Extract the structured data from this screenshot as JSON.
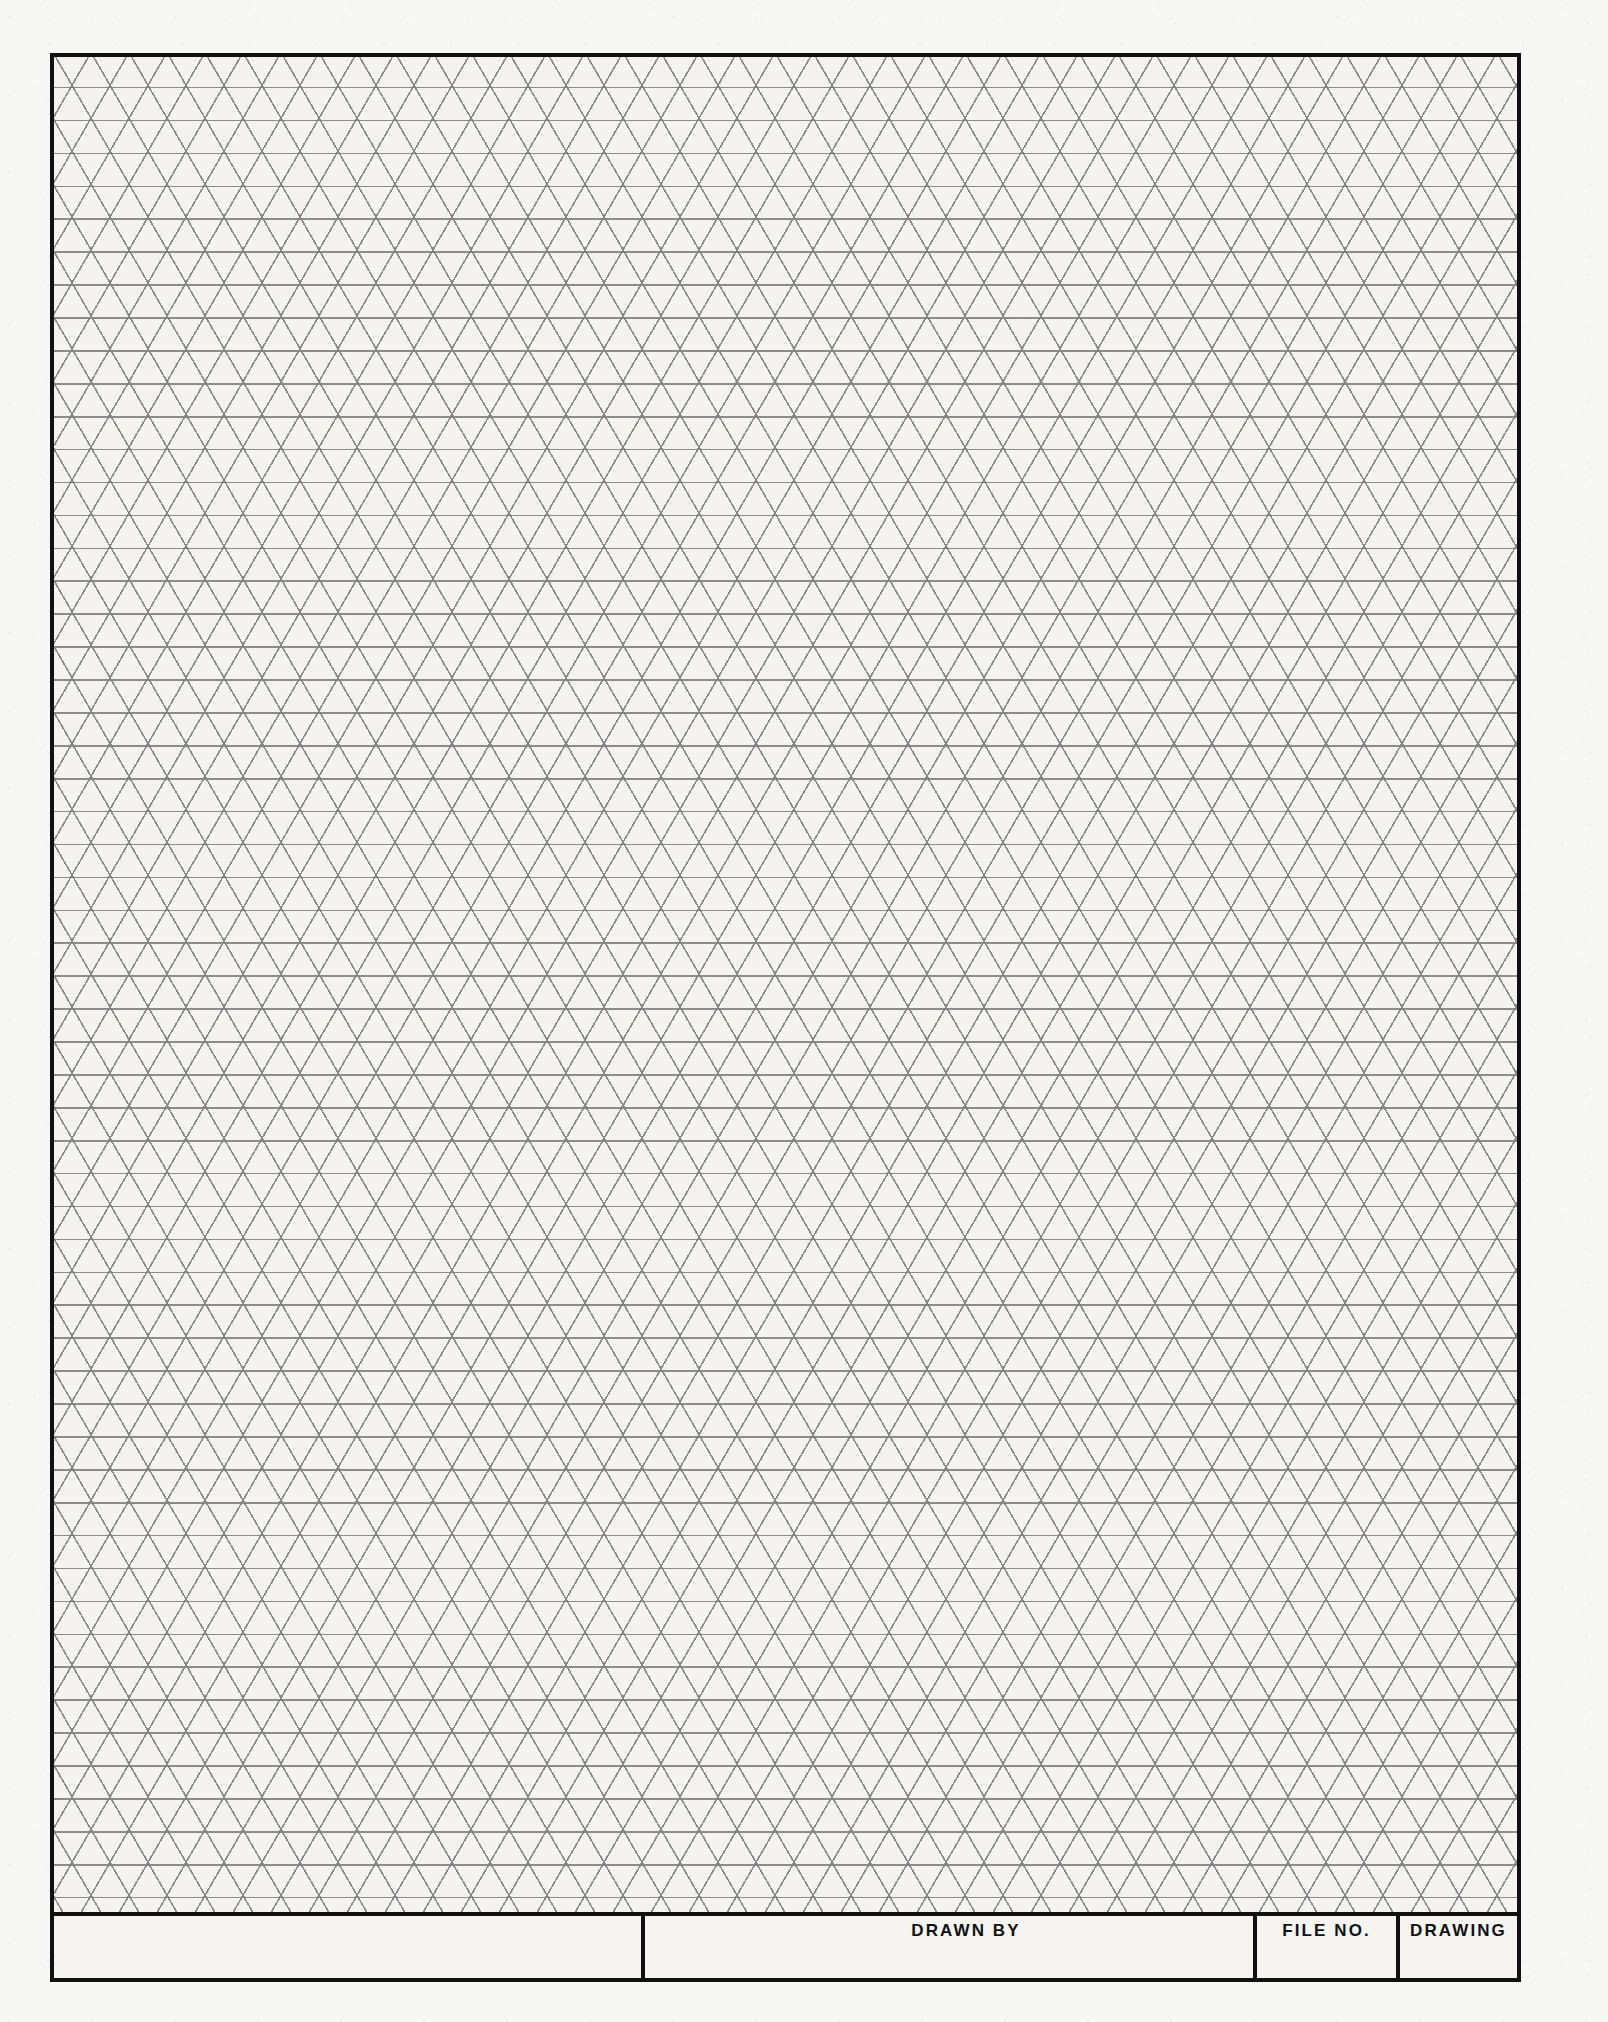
{
  "document": {
    "type": "isometric-graph-paper",
    "sheet_width": 1608,
    "sheet_height": 2022
  },
  "colors": {
    "page_background": "#ffffff",
    "paper": "#f7f7f5",
    "grid_line": "#767676",
    "frame": "#111111",
    "text": "#121212"
  },
  "grid": {
    "style": "isometric-triangular",
    "horizontal_pitch_px": 38,
    "row_height_px": 32.9,
    "angles_deg": [
      0,
      60,
      -60
    ],
    "line_weight_px": 1.6
  },
  "frame": {
    "left": 50,
    "top": 53,
    "width": 1471,
    "height": 1929,
    "border_px": 4
  },
  "title_block": {
    "top": 1912,
    "height": 70,
    "cells": [
      {
        "label": "",
        "name": "blank-cell-1"
      },
      {
        "label": "DRAWN BY",
        "name": "drawn-by-cell"
      },
      {
        "label": "FILE NO.",
        "name": "file-no-cell"
      },
      {
        "label": "DRAWING",
        "name": "drawing-cell"
      }
    ]
  }
}
